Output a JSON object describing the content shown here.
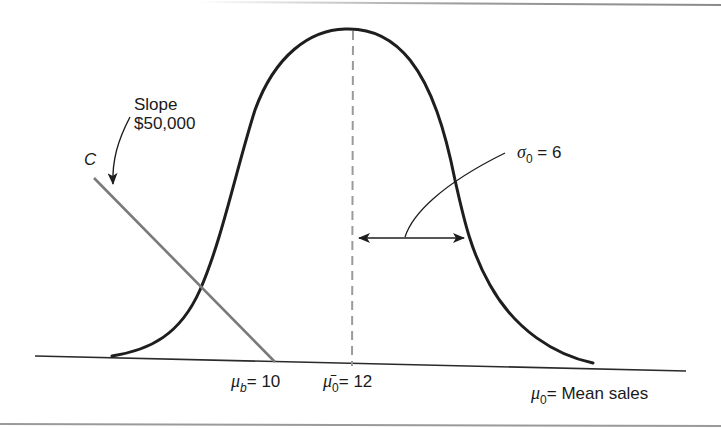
{
  "diagram": {
    "type": "normal distribution with break-even cost line",
    "colors": {
      "curve": "#1e1e1e",
      "cost_line": "#7a7a7a",
      "dashed_mean": "#9a9a9a",
      "axis": "#2a2a2a",
      "border": "#8a8a8a"
    },
    "labels": {
      "slope_line1": "Slope",
      "slope_line2": "$50,000",
      "cost_line_name": "C",
      "sigma_symbol": "σ",
      "sigma_sub": "0",
      "sigma_value": "= 6",
      "mu_b_symbol": "μ",
      "mu_b_sub": "b",
      "mu_b_value": "= 10",
      "mu_bar_symbol": "μ̄",
      "mu_bar_sub": "0",
      "mu_bar_value": "= 12",
      "axis_symbol": "μ",
      "axis_sub": "0",
      "axis_value": "= Mean sales"
    },
    "values": {
      "break_even_mean": 10,
      "prior_mean": 12,
      "prior_std_dev": 6,
      "cost_slope": "$50,000"
    }
  }
}
